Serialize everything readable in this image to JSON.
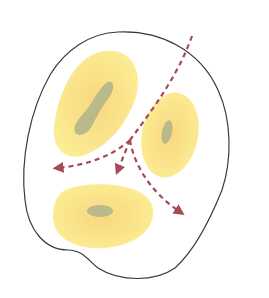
{
  "diagram": {
    "colors": {
      "background": "#ffffff",
      "outline": "#3a3a3a",
      "body_fill": "#fbe98a",
      "body_center": "#f7d37a",
      "nucleus": "#b9b98a",
      "arrow": "#a8495a"
    },
    "elements": {
      "outline": "outer-boundary",
      "bodies": [
        {
          "name": "upper-left-body",
          "nucleus": "elongated"
        },
        {
          "name": "right-body",
          "nucleus": "small"
        },
        {
          "name": "lower-body",
          "nucleus": "oval"
        }
      ],
      "path": {
        "entry": "top-right",
        "branches": [
          "left",
          "down",
          "lower-right"
        ]
      }
    }
  }
}
